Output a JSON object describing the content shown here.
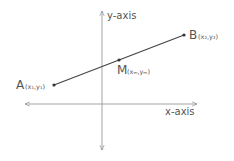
{
  "diagram": {
    "title": "",
    "axes": {
      "x_label": "x-axis",
      "y_label": "y-axis"
    },
    "points": [
      {
        "id": "A",
        "label": "A",
        "coords": "(x₁,y₁)"
      },
      {
        "id": "B",
        "label": "B",
        "coords": "(x₂,y₂)"
      },
      {
        "id": "M",
        "label": "M",
        "coords": "(xₘ,yₘ)"
      }
    ],
    "colors": {
      "axis": "#888888",
      "segment": "#444444",
      "text": "#555555"
    }
  }
}
